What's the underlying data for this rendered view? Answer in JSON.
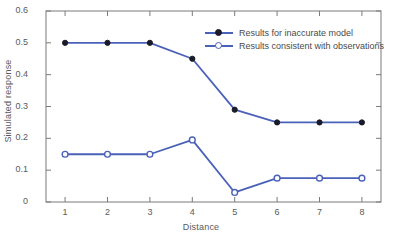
{
  "chart_data": {
    "type": "line",
    "title": "",
    "xlabel": "Distance",
    "ylabel": "Simulated response",
    "x": [
      1,
      2,
      3,
      4,
      5,
      6,
      7,
      8
    ],
    "xtick_labels": [
      "1",
      "2",
      "3",
      "4",
      "5",
      "6",
      "7",
      "8"
    ],
    "ytick_labels": [
      "0.6",
      "0.5",
      "0.4",
      "0.3",
      "0.2",
      "0.1",
      "0"
    ],
    "yticks": [
      0.6,
      0.5,
      0.4,
      0.3,
      0.2,
      0.1,
      0
    ],
    "xlim": [
      0.55,
      8.45
    ],
    "ylim": [
      0,
      0.6
    ],
    "grid": false,
    "legend_position": "top-right-inside",
    "series": [
      {
        "name": "Results for inaccurate model",
        "marker": "filled-circle",
        "marker_color": "#1b1b28",
        "line_color": "#4a61b8",
        "values": [
          0.5,
          0.5,
          0.5,
          0.45,
          0.29,
          0.25,
          0.25,
          0.25
        ]
      },
      {
        "name": "Results consistent with observations",
        "marker": "open-circle",
        "marker_color": "#ffffff",
        "line_color": "#4a61b8",
        "values": [
          0.15,
          0.15,
          0.15,
          0.195,
          0.03,
          0.075,
          0.075,
          0.075
        ]
      }
    ],
    "colors": {
      "line": "#4a61b8",
      "filled_marker": "#1b1b28",
      "open_marker_fill": "#ffffff",
      "axis": "#7a7a7a",
      "text": "#5a5a5a",
      "background": "#ffffff"
    }
  }
}
